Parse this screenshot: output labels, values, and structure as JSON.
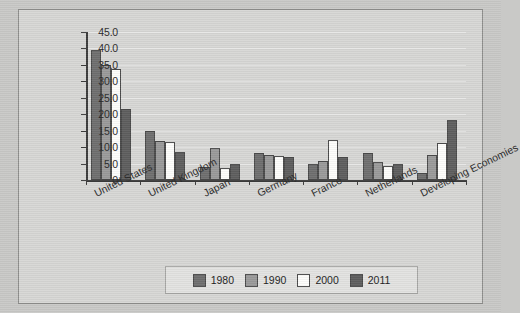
{
  "chart_data": {
    "type": "bar",
    "title": "",
    "subtitle": "",
    "xlabel": "",
    "ylabel": "",
    "ylim": [
      0,
      45
    ],
    "ytick_step": 5,
    "grid": true,
    "legend_position": "bottom",
    "categories": [
      "United States",
      "United Kingdom",
      "Japan",
      "Germany",
      "France",
      "Netherlands",
      "Developing Economies"
    ],
    "ytick_labels": [
      "45.0",
      "40.0",
      "35.0",
      "30.0",
      "25.0",
      "20.0",
      "15.0",
      "10.0",
      "5.0",
      "0"
    ],
    "series": [
      {
        "name": "1980",
        "color": "#6f6f6f",
        "values": [
          39.5,
          14.8,
          4.0,
          8.3,
          5.0,
          8.2,
          2.0
        ]
      },
      {
        "name": "1990",
        "color": "#9a9a9a",
        "values": [
          35.0,
          11.8,
          9.8,
          7.6,
          5.8,
          5.5,
          7.6
        ]
      },
      {
        "name": "2000",
        "color": "#fdfdfb",
        "values": [
          33.8,
          11.5,
          3.8,
          7.2,
          12.1,
          4.3,
          11.4
        ]
      },
      {
        "name": "2011",
        "color": "#5e5e5e",
        "values": [
          21.5,
          8.5,
          4.8,
          7.1,
          7.0,
          5.0,
          18.3
        ]
      }
    ]
  }
}
